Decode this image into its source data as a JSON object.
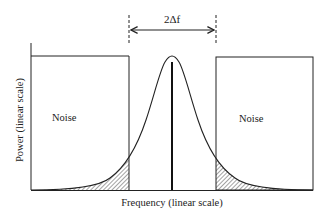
{
  "diagram": {
    "title": "",
    "bandwidth_label": "2Δf",
    "left_box_label": "Noise",
    "right_box_label": "Noise",
    "x_axis_label": "Frequency (linear scale)",
    "y_axis_label": "Power (linear scale)",
    "colors": {
      "stroke": "#222222",
      "background": "#ffffff"
    }
  }
}
